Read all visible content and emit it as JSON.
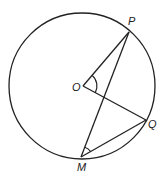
{
  "diagram": {
    "type": "circle-geometry",
    "stroke_color": "#222222",
    "background": "#ffffff",
    "circle": {
      "center_label": "O"
    },
    "points": {
      "O": {
        "label": "O"
      },
      "P": {
        "label": "P"
      },
      "Q": {
        "label": "Q"
      },
      "M": {
        "label": "M"
      }
    },
    "segments": [
      "OP",
      "OQ",
      "MP",
      "MQ"
    ],
    "angles_marked": [
      "POQ",
      "PMQ"
    ]
  }
}
